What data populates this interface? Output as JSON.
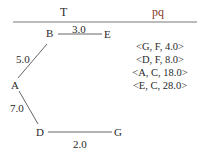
{
  "headers": {
    "tree": "T",
    "queue": "pq"
  },
  "colors": {
    "text": "#2a2a2a",
    "pq_header": "#8a3a2a",
    "line": "#555555"
  },
  "nodes": {
    "A": "A",
    "B": "B",
    "D": "D",
    "E": "E",
    "G": "G"
  },
  "edges": [
    {
      "from": "B",
      "to": "E",
      "weight": "3.0"
    },
    {
      "from": "A",
      "to": "B",
      "weight": "5.0"
    },
    {
      "from": "A",
      "to": "D",
      "weight": "7.0"
    },
    {
      "from": "D",
      "to": "G",
      "weight": "2.0"
    }
  ],
  "priority_queue": [
    "<G, F, 4.0>",
    "<D, F, 8.0>",
    "<A, C, 18.0>",
    "<E, C, 28.0>"
  ]
}
